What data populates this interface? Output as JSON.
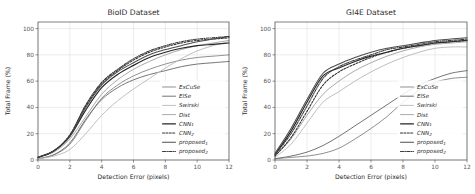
{
  "figure": {
    "panels": [
      {
        "id": "bioid",
        "title": "BioID Dataset",
        "xlabel": "Detection Error (pixels)",
        "ylabel": "Total Frame (%)"
      },
      {
        "id": "gi4e",
        "title": "GI4E Dataset",
        "xlabel": "Detection Error (pixels)",
        "ylabel": "Total Frame (%)"
      }
    ]
  },
  "axis": {
    "xticks": [
      "0",
      "2",
      "4",
      "6",
      "8",
      "10",
      "12"
    ],
    "yticks": [
      "0",
      "20",
      "40",
      "60",
      "80",
      "100"
    ],
    "xlim": [
      0,
      12
    ],
    "ylim": [
      0,
      105
    ]
  },
  "legend": {
    "position": "lower right",
    "entries": [
      {
        "label": "ExCuSe",
        "color": "#8a8a8a",
        "dash": "none",
        "width": 0.95
      },
      {
        "label": "ElSe",
        "color": "#6e6e6e",
        "dash": "none",
        "width": 0.95
      },
      {
        "label": "Swirski",
        "color": "#bcbcbc",
        "dash": "none",
        "width": 0.95
      },
      {
        "label": "Dist",
        "color": "#a5a5a5",
        "dash": "none",
        "width": 0.95
      },
      {
        "label": "CNN1",
        "color": "#262626",
        "dash": "none",
        "width": 1.15
      },
      {
        "label": "CNN2",
        "color": "#2e2e2e",
        "dash": "2,1.4",
        "width": 1.05
      },
      {
        "label": "proposed1",
        "color": "#4d4d4d",
        "dash": "none",
        "width": 1.05
      },
      {
        "label": "proposed2",
        "color": "#3a3a3a",
        "dash": "3,1.2,0.8,1.2",
        "width": 1.05
      }
    ],
    "labels_display": [
      {
        "base": "ExCuSe",
        "sub": ""
      },
      {
        "base": "ElSe",
        "sub": ""
      },
      {
        "base": "Swirski",
        "sub": ""
      },
      {
        "base": "Dist",
        "sub": ""
      },
      {
        "base": "CNN",
        "sub": "1"
      },
      {
        "base": "CNN",
        "sub": "2"
      },
      {
        "base": "proposed",
        "sub": "1"
      },
      {
        "base": "proposed",
        "sub": "2"
      }
    ]
  },
  "chart_data": [
    {
      "type": "line",
      "title": "BioID Dataset",
      "xlabel": "Detection Error (pixels)",
      "ylabel": "Total Frame (%)",
      "xlim": [
        0,
        12
      ],
      "ylim": [
        0,
        105
      ],
      "grid": true,
      "legend": "lower right",
      "x": [
        0,
        1,
        2,
        3,
        4,
        5,
        6,
        7,
        8,
        9,
        10,
        11,
        12
      ],
      "series": [
        {
          "name": "ExCuSe",
          "values": [
            1,
            4,
            12,
            30,
            47,
            57,
            64,
            69,
            73,
            76,
            78,
            79,
            80
          ]
        },
        {
          "name": "ElSe",
          "values": [
            1,
            4,
            13,
            31,
            46,
            55,
            61,
            65,
            68,
            71,
            73,
            74,
            75
          ]
        },
        {
          "name": "Swirski",
          "values": [
            1,
            3,
            8,
            20,
            34,
            45,
            54,
            62,
            70,
            77,
            83,
            87,
            90
          ]
        },
        {
          "name": "Dist",
          "values": [
            2,
            6,
            16,
            33,
            50,
            61,
            69,
            75,
            80,
            84,
            87,
            89,
            91
          ]
        },
        {
          "name": "CNN1",
          "values": [
            2,
            7,
            18,
            38,
            55,
            65,
            72,
            78,
            82,
            85,
            87,
            88,
            89
          ]
        },
        {
          "name": "CNN2",
          "values": [
            2,
            7,
            19,
            41,
            58,
            68,
            76,
            82,
            86,
            89,
            91,
            92,
            93
          ]
        },
        {
          "name": "proposed1",
          "values": [
            2,
            7,
            18,
            40,
            57,
            67,
            74,
            80,
            84,
            87,
            90,
            92,
            94
          ]
        },
        {
          "name": "proposed2",
          "values": [
            2,
            7,
            19,
            42,
            59,
            69,
            77,
            83,
            87,
            90,
            92,
            93,
            94
          ]
        }
      ]
    },
    {
      "type": "line",
      "title": "GI4E Dataset",
      "xlabel": "Detection Error (pixels)",
      "ylabel": "Total Frame (%)",
      "xlim": [
        0,
        12
      ],
      "ylim": [
        0,
        105
      ],
      "grid": true,
      "legend": "lower right",
      "x": [
        0,
        1,
        2,
        3,
        4,
        5,
        6,
        7,
        8,
        9,
        10,
        11,
        12
      ],
      "series": [
        {
          "name": "ExCuSe",
          "values": [
            1,
            2,
            3,
            5,
            9,
            16,
            24,
            33,
            44,
            53,
            59,
            62,
            63
          ]
        },
        {
          "name": "ElSe",
          "values": [
            1,
            3,
            6,
            11,
            18,
            26,
            34,
            42,
            50,
            57,
            62,
            66,
            68
          ]
        },
        {
          "name": "Swirski",
          "values": [
            2,
            12,
            28,
            44,
            52,
            60,
            67,
            73,
            78,
            82,
            85,
            86,
            86
          ]
        },
        {
          "name": "Dist",
          "values": [
            3,
            16,
            34,
            50,
            60,
            68,
            74,
            79,
            83,
            86,
            88,
            89,
            90
          ]
        },
        {
          "name": "CNN1",
          "values": [
            4,
            22,
            44,
            64,
            70,
            75,
            79,
            82,
            85,
            87,
            89,
            90,
            91
          ]
        },
        {
          "name": "CNN2",
          "values": [
            3,
            17,
            37,
            57,
            67,
            73,
            78,
            82,
            85,
            87,
            89,
            90,
            91
          ]
        },
        {
          "name": "proposed1",
          "values": [
            5,
            24,
            46,
            66,
            73,
            78,
            82,
            85,
            87,
            89,
            91,
            92,
            93
          ]
        },
        {
          "name": "proposed2",
          "values": [
            4,
            20,
            41,
            62,
            71,
            76,
            80,
            84,
            86,
            88,
            90,
            91,
            92
          ]
        }
      ]
    }
  ]
}
